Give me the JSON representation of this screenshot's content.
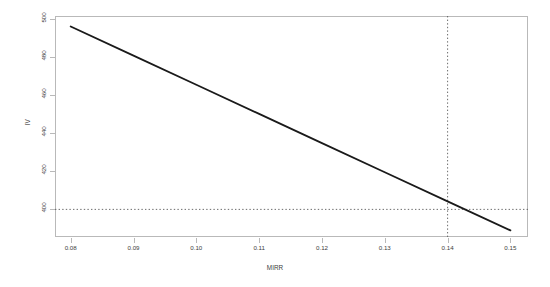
{
  "chart_data": {
    "type": "line",
    "title": "",
    "xlabel": "MIRR",
    "ylabel": "IV",
    "xlim": [
      0.0775,
      0.1528
    ],
    "ylim": [
      385.5,
      501.5
    ],
    "grid": false,
    "legend": null,
    "xticks": [
      0.08,
      0.09,
      0.1,
      0.11,
      0.12,
      0.13,
      0.14,
      0.15
    ],
    "xtick_labels": [
      "0.08",
      "0.09",
      "0.10",
      "0.11",
      "0.12",
      "0.13",
      "0.14",
      "0.15"
    ],
    "yticks": [
      400,
      420,
      440,
      460,
      480,
      500
    ],
    "ytick_labels": [
      "400",
      "420",
      "440",
      "460",
      "480",
      "500"
    ],
    "series": [
      {
        "name": "IV vs MIRR",
        "color": "#1a1a1a",
        "width": 1.8,
        "style": "solid",
        "x": [
          0.08,
          0.09,
          0.1,
          0.11,
          0.12,
          0.13,
          0.14,
          0.15
        ],
        "values": [
          496.0,
          480.7,
          465.4,
          450.1,
          434.8,
          419.5,
          404.2,
          389.0
        ]
      }
    ],
    "reference_lines": [
      {
        "name": "vertical-reference",
        "orientation": "vertical",
        "value": 0.14,
        "style": "dotted",
        "color": "#5a5a5a"
      },
      {
        "name": "horizontal-reference",
        "orientation": "horizontal",
        "value": 400,
        "style": "dotted",
        "color": "#5a5a5a"
      }
    ],
    "intersection": {
      "x": 0.14,
      "y": 400
    }
  },
  "axis": {
    "x_title": "MIRR",
    "y_title": "IV",
    "x_labels": [
      "0.08",
      "0.09",
      "0.10",
      "0.11",
      "0.12",
      "0.13",
      "0.14",
      "0.15"
    ],
    "y_labels": [
      "500",
      "480",
      "460",
      "440",
      "420",
      "400"
    ]
  },
  "colors": {
    "line": "#1a1a1a",
    "frame": "#b9b9b9",
    "reference": "#5a5a5a",
    "text": "#3d3d3d",
    "background": "#ffffff"
  }
}
